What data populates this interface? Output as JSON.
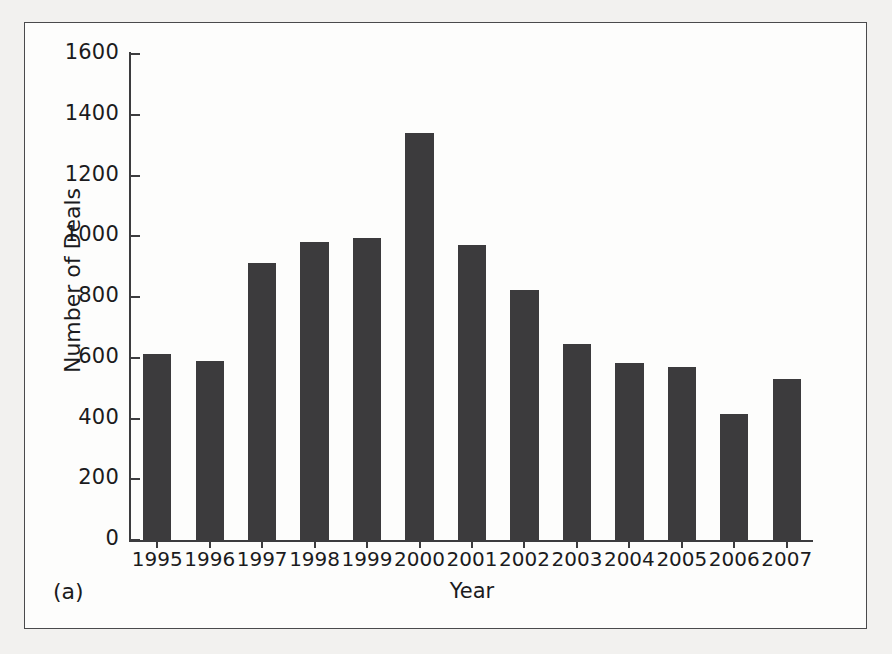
{
  "figure": {
    "panel_label": "(a)",
    "frame_color": "#4a4a4c",
    "background_color": "#fdfdfc",
    "page_background_color": "#f2f1ef"
  },
  "chart_data": {
    "type": "bar",
    "title": "",
    "xlabel": "Year",
    "ylabel": "Number of Deals",
    "categories": [
      "1995",
      "1996",
      "1997",
      "1998",
      "1999",
      "2000",
      "2001",
      "2002",
      "2003",
      "2004",
      "2005",
      "2006",
      "2007"
    ],
    "values": [
      612,
      590,
      912,
      980,
      995,
      1340,
      972,
      822,
      645,
      583,
      570,
      415,
      530
    ],
    "ylim": [
      0,
      1600
    ],
    "yticks": [
      0,
      200,
      400,
      600,
      800,
      1000,
      1200,
      1400,
      1600
    ],
    "ytick_labels": [
      "0",
      "200",
      "400",
      "600",
      "800",
      "1000",
      "1200",
      "1400",
      "1600"
    ],
    "grid": false,
    "legend": null,
    "bar_color": "#3c3b3d",
    "axis_color": "#3c3c3e"
  }
}
